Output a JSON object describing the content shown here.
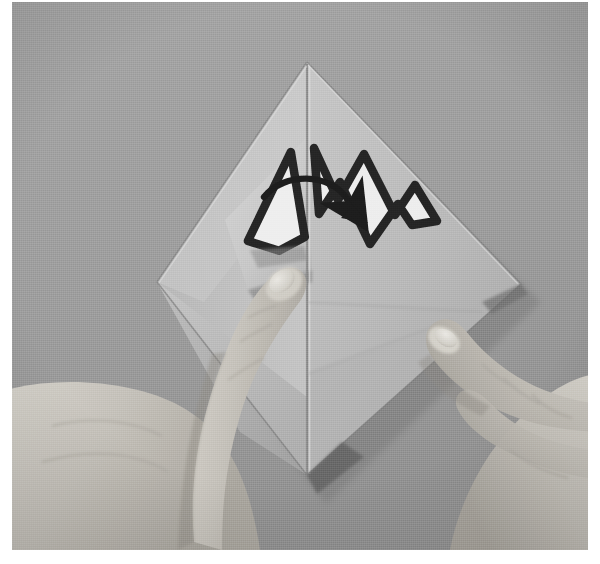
{
  "photo": {
    "title": "Origami folding step photograph",
    "medium": "black-and-white photograph",
    "subject": "Two hands folding a square sheet of paper into a diamond orientation",
    "alt_text": "A grayscale photograph of a diamond-shaped folded paper sheet on a gray surface. A printed mountain-fold symbol shaped like a letter M sits near the top centre, with a curved arrow sweeping from the left peak to the right. A left index finger presses the lower-left flap while a right index finger supports the right edge.",
    "background_color": "#9b9b9b",
    "paper_color": "#c6c6c6",
    "ink_color": "#1e1e1e",
    "skin_color": "#c9c5bd",
    "border_color": "#ffffff"
  },
  "scene": {
    "elements": [
      {
        "name": "background-surface",
        "label": "Gray textured backdrop",
        "tone": "#9b9b9b"
      },
      {
        "name": "paper-diamond",
        "label": "Folded paper in diamond orientation",
        "tone": "#c6c6c6"
      },
      {
        "name": "center-crease",
        "label": "Vertical centre crease",
        "tone": "#8f8f8f"
      },
      {
        "name": "left-flap",
        "label": "Lifted left flap being rotated",
        "tone": "#cfcfcf"
      },
      {
        "name": "right-panel",
        "label": "Right paper panel",
        "tone": "#b9b9b9"
      },
      {
        "name": "left-hand",
        "label": "Left hand index finger pressing the flap",
        "tone": "#cac6be"
      },
      {
        "name": "right-hand",
        "label": "Right hand index finger supporting the edge",
        "tone": "#cac6be"
      }
    ]
  },
  "diagram_marks": {
    "mountain_symbol": {
      "name": "mountain-fold-symbol",
      "label": "M",
      "description": "Bold outlined letter M drawn across the paper, split by the centre crease",
      "outline_color": "#1e1e1e",
      "fill_color": "#f2f2f2",
      "stroke_width_px": 7
    },
    "rotation_arrow": {
      "name": "rotation-arrow",
      "label": "rotate flap right",
      "description": "Curved arrow sweeping from the left peak over to the right, indicating the flap swings to the right",
      "color": "#141414",
      "direction": "left-to-right"
    }
  },
  "geometry": {
    "diamond": {
      "top": [
        307,
        66
      ],
      "left": [
        157,
        282
      ],
      "right": [
        521,
        286
      ],
      "bottom": [
        307,
        481
      ]
    },
    "photo_rect": {
      "x": 12,
      "y": 2,
      "w": 576,
      "h": 548
    }
  }
}
